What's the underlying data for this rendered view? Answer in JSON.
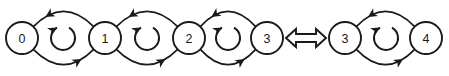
{
  "figure": {
    "type": "state-transition-diagram",
    "background_color": "#ffffff",
    "line_color": "#1a1a1a",
    "equivalence_symbol": "double-headed-horizontal-arrow",
    "groups": [
      {
        "name": "left-chain",
        "nodes": [
          {
            "label": "0",
            "cx": 22,
            "cy": 38,
            "r": 16
          },
          {
            "label": "1",
            "cx": 105,
            "cy": 38,
            "r": 16
          },
          {
            "label": "2",
            "cx": 189,
            "cy": 38,
            "r": 16
          },
          {
            "label": "3",
            "cx": 267,
            "cy": 38,
            "r": 16
          }
        ],
        "edges": [
          {
            "from": "1",
            "to": "0",
            "position": "top",
            "arrow": "left"
          },
          {
            "from": "0",
            "to": "1",
            "position": "bottom",
            "arrow": "right"
          },
          {
            "from": "2",
            "to": "1",
            "position": "top",
            "arrow": "left"
          },
          {
            "from": "1",
            "to": "2",
            "position": "bottom",
            "arrow": "right"
          },
          {
            "from": "3",
            "to": "2",
            "position": "top",
            "arrow": "left"
          },
          {
            "from": "2",
            "to": "3",
            "position": "bottom",
            "arrow": "right"
          }
        ],
        "loops": [
          {
            "cx": 63,
            "cy": 38,
            "r": 12,
            "direction": "clockwise"
          },
          {
            "cx": 147,
            "cy": 38,
            "r": 12,
            "direction": "clockwise"
          },
          {
            "cx": 228,
            "cy": 38,
            "r": 12,
            "direction": "clockwise"
          }
        ]
      },
      {
        "name": "right-chain",
        "nodes": [
          {
            "label": "3",
            "cx": 345,
            "cy": 38,
            "r": 16
          },
          {
            "label": "4",
            "cx": 426,
            "cy": 38,
            "r": 16
          }
        ],
        "edges": [
          {
            "from": "4",
            "to": "3",
            "position": "top",
            "arrow": "left"
          },
          {
            "from": "3",
            "to": "4",
            "position": "bottom",
            "arrow": "right"
          }
        ],
        "loops": [
          {
            "cx": 386,
            "cy": 38,
            "r": 12,
            "direction": "clockwise"
          }
        ]
      }
    ],
    "connector": {
      "name": "equivalence-arrow",
      "cx": 306,
      "cy": 38,
      "half_width": 20,
      "shaft_half_height": 4,
      "head_half_height": 9,
      "head_length": 10
    }
  }
}
